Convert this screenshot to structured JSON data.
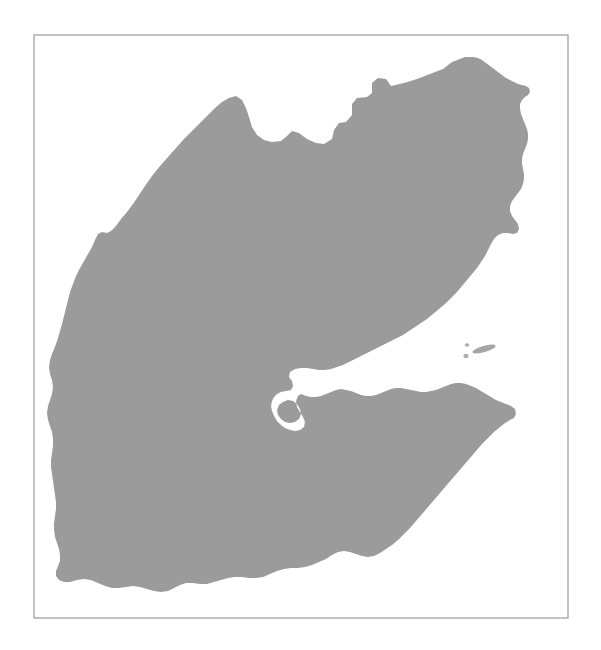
{
  "figure": {
    "kind": "map-silhouette",
    "title": "",
    "caption": "",
    "background_color": "#ffffff",
    "land_color": "#9b9b9b",
    "frame_color": "#9a9a9a",
    "frame_stroke_width": 1.2,
    "canvas": {
      "width": 601,
      "height": 650
    }
  },
  "frame": {
    "name": "map-border-frame",
    "x": 34,
    "y": 35,
    "width": 534,
    "height": 583
  },
  "map_data": {
    "type": "silhouette",
    "projection": "unspecified",
    "features": [
      {
        "name": "djibouti-mainland",
        "role": "landmass",
        "fill": "#9b9b9b",
        "path": "M 465,57 L 452,62 L 443,69 L 430,74 L 417,79 L 404,83 L 391,86 L 386,79 L 378,78 L 372,83 L 372,93 L 367,97 L 357,98 L 352,104 L 352,115 L 346,122 L 339,123 L 334,130 L 332,139 L 324,144 L 316,143 L 307,139 L 299,133 L 292,131 L 287,136 L 281,141 L 272,142 L 264,140 L 257,135 L 252,127 L 249,117 L 246,108 L 242,100 L 236,96 L 229,98 L 222,102 L 215,108 L 208,115 L 200,123 L 192,131 L 184,139 L 176,148 L 168,157 L 160,166 L 152,176 L 145,186 L 139,195 L 133,204 L 127,212 L 121,219 L 116,226 L 111,231 L 107,233 L 102,232 L 98,234 L 95,240 L 92,247 L 88,254 L 84,261 L 80,268 L 76,276 L 73,284 L 70,292 L 68,300 L 66,308 L 64,316 L 62,324 L 60,331 L 58,338 L 56,344 L 54,349 L 52,354 L 50,360 L 49,367 L 50,374 L 52,380 L 53,387 L 52,394 L 50,400 L 48,406 L 47,413 L 48,420 L 50,426 L 52,432 L 53,439 L 53,446 L 52,453 L 51,460 L 51,467 L 52,474 L 53,481 L 54,488 L 55,495 L 56,502 L 56,509 L 55,516 L 54,523 L 54,530 L 55,537 L 57,543 L 59,549 L 60,555 L 60,561 L 58,566 L 56,571 L 56,576 L 59,580 L 64,582 L 70,582 L 77,580 L 84,579 L 91,580 L 98,583 L 105,586 L 112,588 L 119,588 L 126,587 L 133,586 L 140,587 L 147,589 L 154,591 L 161,592 L 168,591 L 174,588 L 180,585 L 186,583 L 193,583 L 200,584 L 207,584 L 214,582 L 221,580 L 228,578 L 235,577 L 242,577 L 249,578 L 256,578 L 263,577 L 270,574 L 277,571 L 284,569 L 291,568 L 298,568 L 305,567 L 312,565 L 319,562 L 326,559 L 332,555 L 338,552 L 344,551 L 350,552 L 356,554 L 362,556 L 368,557 L 374,556 L 380,553 L 386,549 L 392,545 L 398,540 L 404,534 L 410,528 L 416,521 L 422,514 L 428,507 L 434,500 L 440,493 L 446,486 L 452,479 L 458,472 L 464,465 L 470,458 L 476,451 L 482,444 L 488,438 L 494,432 L 500,427 L 505,423 L 510,420 L 514,418 L 516,414 L 515,409 L 511,406 L 506,404 L 501,402 L 496,400 L 491,397 L 486,394 L 481,391 L 476,388 L 471,386 L 466,384 L 461,383 L 456,383 L 451,384 L 446,386 L 441,388 L 436,390 L 431,391 L 426,392 L 421,392 L 416,391 L 411,390 L 406,389 L 401,388 L 396,388 L 391,389 L 386,391 L 381,393 L 376,395 L 371,396 L 366,396 L 361,395 L 356,393 L 351,391 L 346,390 L 341,389 L 336,390 L 331,392 L 326,394 L 321,396 L 316,397 L 311,397 L 306,396 L 301,394 L 298,396 L 296,401 L 297,407 L 300,412 L 303,417 L 305,422 L 304,427 L 300,430 L 295,431 L 290,430 L 285,428 L 281,425 L 277,421 L 274,416 L 272,411 L 271,406 L 272,401 L 274,397 L 277,394 L 281,392 L 286,391 L 291,390 L 293,386 L 292,381 L 289,377 L 290,372 L 295,369 L 301,368 L 307,368 L 313,369 L 319,370 L 325,370 L 331,369 L 337,367 L 343,365 L 349,362 L 355,359 L 361,356 L 367,353 L 373,350 L 379,347 L 385,344 L 391,341 L 397,338 L 403,335 L 409,331 L 415,327 L 421,323 L 427,319 L 433,314 L 439,309 L 445,304 L 451,298 L 457,292 L 462,286 L 467,280 L 472,274 L 477,268 L 481,262 L 485,256 L 488,250 L 491,244 L 494,239 L 498,235 L 503,233 L 508,233 L 513,234 L 517,233 L 519,229 L 518,224 L 515,220 L 512,216 L 510,211 L 510,206 L 512,201 L 515,197 L 518,193 L 521,189 L 523,184 L 524,179 L 524,174 L 523,169 L 522,164 L 522,159 L 523,154 L 525,149 L 527,144 L 528,139 L 528,134 L 527,129 L 525,124 L 523,119 L 521,114 L 520,109 L 520,104 L 522,100 L 525,97 L 528,95 L 530,92 L 529,88 L 526,86 L 522,85 L 518,84 L 514,82 L 510,80 L 506,78 L 502,75 L 498,72 L 494,69 L 490,66 L 486,63 L 482,60 L 478,58 L 473,57 Z M 283,402 L 288,400 L 293,401 L 297,404 L 300,409 L 301,414 L 299,419 L 295,422 L 290,423 L 285,422 L 281,419 L 278,415 L 277,410 L 279,405 Z"
      },
      {
        "name": "djibouti-northeast-lobe",
        "role": "landmass",
        "fill": "#9b9b9b",
        "path": ""
      }
    ],
    "islands": [
      {
        "name": "moucha-island",
        "role": "island",
        "fill": "#a5a5a5",
        "cx": 484,
        "cy": 349,
        "rx": 12,
        "ry": 3.2,
        "rotate": -16
      },
      {
        "name": "maskali-island",
        "role": "island",
        "fill": "#b0b0b0",
        "cx": 467,
        "cy": 345,
        "rx": 2.4,
        "ry": 1.8,
        "rotate": 0
      },
      {
        "name": "small-islet",
        "role": "island",
        "fill": "#b0b0b0",
        "cx": 466,
        "cy": 356,
        "rx": 2.6,
        "ry": 2.2,
        "rotate": 0
      }
    ],
    "water_bodies": [
      {
        "name": "gulf-of-tadjoura",
        "label": ""
      },
      {
        "name": "ghoubbet-el-kharab",
        "label": ""
      }
    ],
    "labels": [],
    "legend": [],
    "scale_bar": null,
    "north_arrow": null
  }
}
